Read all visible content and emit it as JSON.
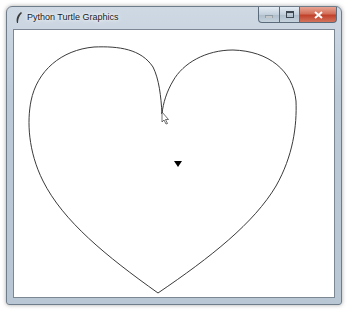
{
  "window": {
    "title": "Python Turtle Graphics",
    "app_icon": "feather-icon",
    "controls": {
      "minimize": "minimize-icon",
      "maximize": "maximize-icon",
      "close": "close-icon"
    }
  },
  "canvas": {
    "background": "#ffffff",
    "drawing": {
      "shape": "heart",
      "stroke_color": "#000000",
      "fill": "none"
    },
    "turtle": {
      "shape": "classic-arrow",
      "heading": "down",
      "color": "#000000"
    },
    "mouse_cursor": "arrow-pointer"
  }
}
